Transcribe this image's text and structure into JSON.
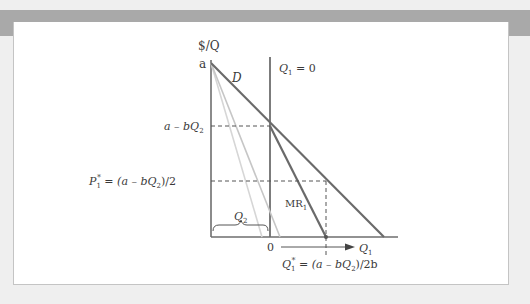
{
  "figure": {
    "y_axis_label": "$/Q",
    "x_axis_label": "Q",
    "x_axis_label_sub": "1",
    "origin_label": "0",
    "intercept_label": "a",
    "demand_label": "D",
    "mr_label": "MR",
    "mr_label_sub": "1",
    "constraint_label": "Q",
    "constraint_label_sub": "1",
    "constraint_label_rest": " = 0",
    "residual_price_label": "a – bQ",
    "residual_price_sub": "2",
    "optimal_price_label_lhs": "P",
    "optimal_price_label_sub": "1",
    "optimal_price_label_sup": "*",
    "optimal_price_label_rhs": " = (a – bQ",
    "optimal_price_label_rhs_sub": "2",
    "optimal_price_label_rhs_end": ")/2",
    "optimal_qty_label_lhs": "Q",
    "optimal_qty_label_sub": "1",
    "optimal_qty_label_sup": "*",
    "optimal_qty_label_rhs": " = (a – bQ",
    "optimal_qty_label_rhs_sub": "2",
    "optimal_qty_label_rhs_end": ")/2b",
    "brace_label": "Q",
    "brace_label_sub": "2"
  },
  "colors": {
    "frame_band": "#a9a9a9",
    "background": "#efefef",
    "panel": "#ffffff",
    "axis": "#6e6e6e",
    "demand": "#6a6a6a",
    "mr": "#6a6a6a",
    "mr_light": "#c8c8c8",
    "dashed": "#555555",
    "text": "#3a3a3a"
  }
}
